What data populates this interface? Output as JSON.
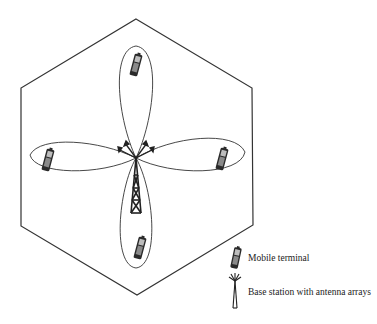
{
  "diagram": {
    "title": "",
    "cell_shape": "hexagon",
    "center_element": "base-station",
    "beams": [
      {
        "direction": "up",
        "has_terminal": true
      },
      {
        "direction": "left",
        "has_terminal": true
      },
      {
        "direction": "right",
        "has_terminal": true
      },
      {
        "direction": "down",
        "has_terminal": true
      }
    ],
    "colors": {
      "line": "#333333",
      "terminal": "#2a2a2a",
      "background": "#ffffff"
    }
  },
  "legend": {
    "items": [
      {
        "icon": "mobile-terminal-icon",
        "label": "Mobile terminal"
      },
      {
        "icon": "base-station-icon",
        "label": "Base station with antenna arrays"
      }
    ]
  }
}
